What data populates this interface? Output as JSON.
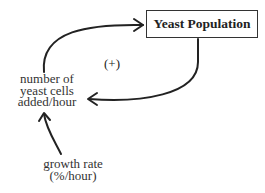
{
  "diagram": {
    "type": "causal-loop",
    "stock": {
      "label": "Yeast Population"
    },
    "flow": {
      "lines": [
        "number of",
        "yeast cells",
        "added/hour"
      ]
    },
    "parameter": {
      "lines": [
        "growth rate",
        "(%/hour)"
      ]
    },
    "loop_polarity": "(+)",
    "links": [
      {
        "from": "number of yeast cells added/hour",
        "to": "Yeast Population"
      },
      {
        "from": "Yeast Population",
        "to": "number of yeast cells added/hour"
      },
      {
        "from": "growth rate (%/hour)",
        "to": "number of yeast cells added/hour"
      }
    ]
  }
}
